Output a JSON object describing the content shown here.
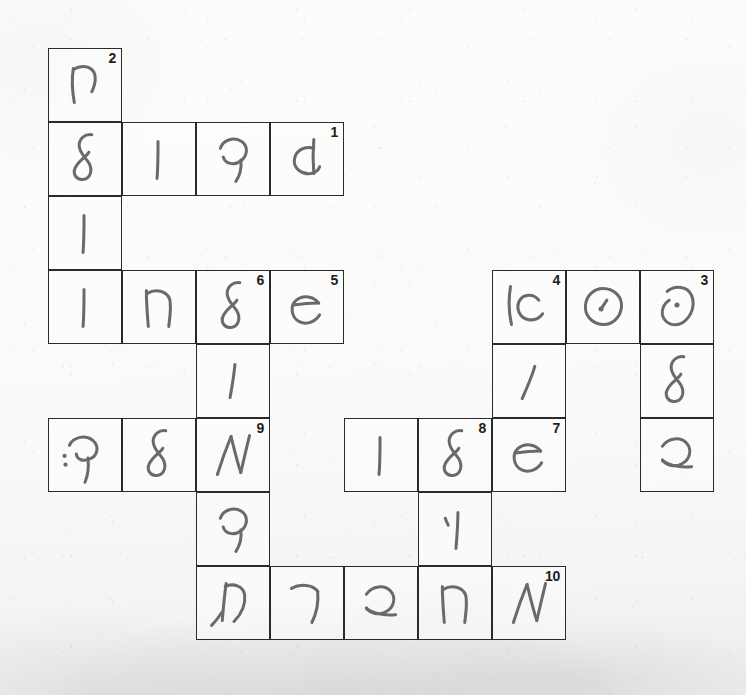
{
  "document": {
    "kind": "handwritten-crossword-scan",
    "title": "Handwritten Crossword Puzzle",
    "paper_color": "#fbfbfa",
    "ink_color": "#6a6a68",
    "grid_line_color": "#2a2a2a",
    "clue_number_color": "#1d1d1d",
    "cell_size_px": 74
  },
  "grid": {
    "columns": 9,
    "rows": 8,
    "origin_x": 48,
    "origin_y": 48,
    "cells": [
      {
        "id": "r0c0",
        "row": 0,
        "col": 0,
        "glyph": "het-like",
        "clue": "2"
      },
      {
        "id": "r1c0",
        "row": 1,
        "col": 0,
        "glyph": "lamed-like",
        "clue": ""
      },
      {
        "id": "r1c1",
        "row": 1,
        "col": 1,
        "glyph": "vav-like",
        "clue": ""
      },
      {
        "id": "r1c2",
        "row": 1,
        "col": 2,
        "glyph": "fey-like",
        "clue": ""
      },
      {
        "id": "r1c3",
        "row": 1,
        "col": 3,
        "glyph": "dalet-like",
        "clue": "1"
      },
      {
        "id": "r2c0",
        "row": 2,
        "col": 0,
        "glyph": "vav-like",
        "clue": ""
      },
      {
        "id": "r3c0",
        "row": 3,
        "col": 0,
        "glyph": "vav-like",
        "clue": ""
      },
      {
        "id": "r3c1",
        "row": 3,
        "col": 1,
        "glyph": "hey-like",
        "clue": ""
      },
      {
        "id": "r3c2",
        "row": 3,
        "col": 2,
        "glyph": "lamed-like",
        "clue": "6"
      },
      {
        "id": "r3c3",
        "row": 3,
        "col": 3,
        "glyph": "ayin-like",
        "clue": "5"
      },
      {
        "id": "r3c6",
        "row": 3,
        "col": 6,
        "glyph": "aleph-kaf",
        "clue": "4"
      },
      {
        "id": "r3c7",
        "row": 3,
        "col": 7,
        "glyph": "samekh-like",
        "clue": ""
      },
      {
        "id": "r3c8",
        "row": 3,
        "col": 8,
        "glyph": "nun-like",
        "clue": "3"
      },
      {
        "id": "r4c2",
        "row": 4,
        "col": 2,
        "glyph": "yod-like",
        "clue": ""
      },
      {
        "id": "r4c6",
        "row": 4,
        "col": 6,
        "glyph": "vav-slant",
        "clue": ""
      },
      {
        "id": "r4c8",
        "row": 4,
        "col": 8,
        "glyph": "lamed-like",
        "clue": ""
      },
      {
        "id": "r5c0",
        "row": 5,
        "col": 0,
        "glyph": "kuf-like",
        "clue": ""
      },
      {
        "id": "r5c1",
        "row": 5,
        "col": 1,
        "glyph": "lamed-like",
        "clue": ""
      },
      {
        "id": "r5c2",
        "row": 5,
        "col": 2,
        "glyph": "aleph-like",
        "clue": "9"
      },
      {
        "id": "r5c4",
        "row": 5,
        "col": 4,
        "glyph": "vav-like",
        "clue": ""
      },
      {
        "id": "r5c5",
        "row": 5,
        "col": 5,
        "glyph": "lamed-like",
        "clue": "8"
      },
      {
        "id": "r5c6",
        "row": 5,
        "col": 6,
        "glyph": "ayin-like",
        "clue": "7"
      },
      {
        "id": "r5c8",
        "row": 5,
        "col": 8,
        "glyph": "bet-like",
        "clue": ""
      },
      {
        "id": "r6c2",
        "row": 6,
        "col": 2,
        "glyph": "fey-like",
        "clue": ""
      },
      {
        "id": "r6c5",
        "row": 6,
        "col": 5,
        "glyph": "vav-dot",
        "clue": ""
      },
      {
        "id": "r7c2",
        "row": 7,
        "col": 2,
        "glyph": "tav-like",
        "clue": ""
      },
      {
        "id": "r7c3",
        "row": 7,
        "col": 3,
        "glyph": "resh-like",
        "clue": ""
      },
      {
        "id": "r7c4",
        "row": 7,
        "col": 4,
        "glyph": "bet-like",
        "clue": ""
      },
      {
        "id": "r7c5",
        "row": 7,
        "col": 5,
        "glyph": "hey-like",
        "clue": ""
      },
      {
        "id": "r7c6",
        "row": 7,
        "col": 6,
        "glyph": "aleph-like",
        "clue": "10"
      }
    ]
  }
}
